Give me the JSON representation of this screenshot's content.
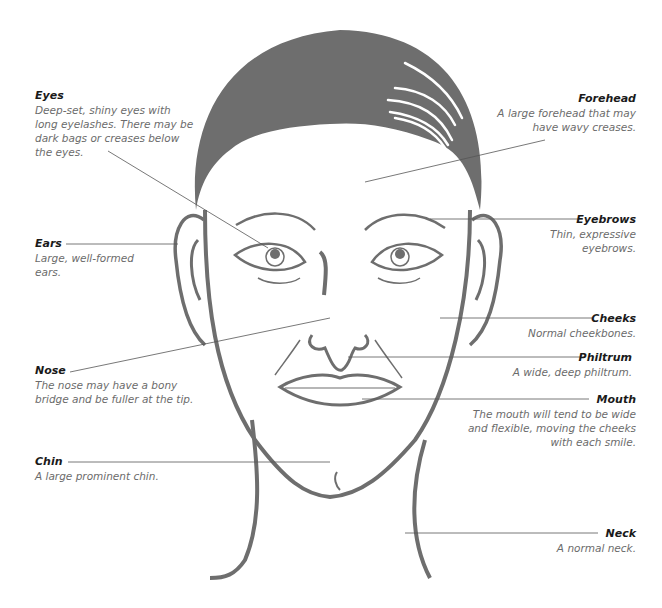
{
  "colors": {
    "hair": "#6e6e6e",
    "outline": "#6e6e6e",
    "leader": "#555555",
    "title": "#1a1a1a",
    "desc": "#6b6b6b"
  },
  "labels": {
    "eyes": {
      "title": "Eyes",
      "desc": "Deep-set, shiny eyes with long eyelashes. There may be dark bags or creases below the eyes."
    },
    "ears": {
      "title": "Ears",
      "desc": "Large, well-formed ears."
    },
    "nose": {
      "title": "Nose",
      "desc": "The nose may have a bony bridge and be fuller at the tip."
    },
    "chin": {
      "title": "Chin",
      "desc": "A large prominent chin."
    },
    "forehead": {
      "title": "Forehead",
      "desc": "A large forehead that may have wavy creases."
    },
    "eyebrows": {
      "title": "Eyebrows",
      "desc": "Thin, expressive eyebrows."
    },
    "cheeks": {
      "title": "Cheeks",
      "desc": "Normal cheekbones."
    },
    "philtrum": {
      "title": "Philtrum",
      "desc": "A wide, deep philtrum."
    },
    "mouth": {
      "title": "Mouth",
      "desc": "The mouth will tend to be wide and flexible, moving the cheeks with each smile."
    },
    "neck": {
      "title": "Neck",
      "desc": "A normal neck."
    }
  }
}
